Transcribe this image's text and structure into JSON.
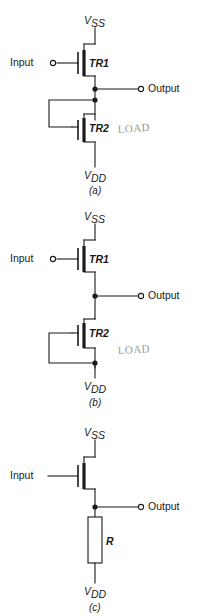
{
  "page": {
    "background_color": "#ffffff",
    "ink_color": "#1a1a1a",
    "annotation_color": "#9a9a9a"
  },
  "figures": [
    {
      "id": "a",
      "caption": "(a)",
      "supply_top": {
        "symbol": "V",
        "subscript": "SS"
      },
      "supply_bottom": {
        "symbol": "V",
        "subscript": "DD"
      },
      "input_label": "Input",
      "input_terminal": "open-circle",
      "output_label": "Output",
      "output_terminal": "open-circle",
      "devices": [
        {
          "name": "TR1",
          "role": "driver"
        },
        {
          "name": "TR2",
          "role": "load"
        }
      ],
      "load_gate_connection": "drain",
      "handwritten_note": "LOAD",
      "junction_dots": 2
    },
    {
      "id": "b",
      "caption": "(b)",
      "supply_top": {
        "symbol": "V",
        "subscript": "SS"
      },
      "supply_bottom": {
        "symbol": "V",
        "subscript": "DD"
      },
      "input_label": "Input",
      "input_terminal": "open-circle",
      "output_label": "Output",
      "output_terminal": "open-circle",
      "devices": [
        {
          "name": "TR1",
          "role": "driver"
        },
        {
          "name": "TR2",
          "role": "load"
        }
      ],
      "load_gate_connection": "source",
      "handwritten_note": "LOAD",
      "junction_dots": 2
    },
    {
      "id": "c",
      "caption": "(c)",
      "supply_top": {
        "symbol": "V",
        "subscript": "SS"
      },
      "supply_bottom": {
        "symbol": "V",
        "subscript": "DD"
      },
      "input_label": "Input",
      "input_terminal": "none",
      "output_label": "Output",
      "output_terminal": "open-circle",
      "devices": [
        {
          "name": "",
          "role": "driver"
        }
      ],
      "resistor_label": "R",
      "handwritten_note": "",
      "junction_dots": 1
    }
  ]
}
